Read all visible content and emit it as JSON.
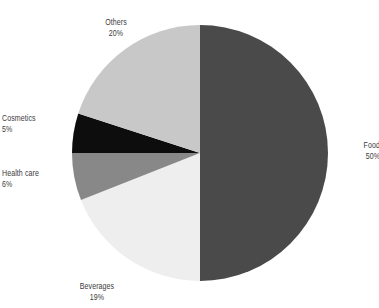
{
  "chart_data": {
    "type": "pie",
    "title": "",
    "subtitle": "",
    "xlabel": "",
    "ylabel": "",
    "legend_position": "none",
    "grid": false,
    "units": "percent",
    "start_angle_deg": 0,
    "direction": "clockwise",
    "categories": [
      "Food",
      "Beverages",
      "Health care",
      "Cosmetics",
      "Others"
    ],
    "values": [
      50,
      19,
      6,
      5,
      20
    ],
    "labels": [
      "50%",
      "19%",
      "6%",
      "5%",
      "20%"
    ],
    "colors": [
      "#4a4a4a",
      "#eeeeee",
      "#888888",
      "#0d0d0d",
      "#c8c8c8"
    ],
    "slices": [
      {
        "name": "Food",
        "value": 50,
        "value_label": "50%",
        "color": "#4a4a4a",
        "start_deg": 0,
        "end_deg": 180
      },
      {
        "name": "Beverages",
        "value": 19,
        "value_label": "19%",
        "color": "#eeeeee",
        "start_deg": 180,
        "end_deg": 248.4
      },
      {
        "name": "Health care",
        "value": 6,
        "value_label": "6%",
        "color": "#888888",
        "start_deg": 248.4,
        "end_deg": 270
      },
      {
        "name": "Cosmetics",
        "value": 5,
        "value_label": "5%",
        "color": "#0d0d0d",
        "start_deg": 270,
        "end_deg": 288
      },
      {
        "name": "Others",
        "value": 20,
        "value_label": "20%",
        "color": "#c8c8c8",
        "start_deg": 288,
        "end_deg": 360
      }
    ]
  },
  "labels": {
    "food": {
      "name": "Food",
      "value": "50%"
    },
    "beverages": {
      "name": "Beverages",
      "value": "19%"
    },
    "healthcare": {
      "name": "Health care",
      "value": "6%"
    },
    "cosmetics": {
      "name": "Cosmetics",
      "value": "5%"
    },
    "others": {
      "name": "Others",
      "value": "20%"
    }
  },
  "style": {
    "background": "#ffffff",
    "text_color": "#3b3b3b"
  }
}
